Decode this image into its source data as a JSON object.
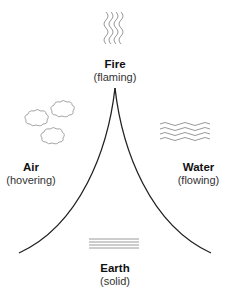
{
  "elements": {
    "fire": {
      "name": "Fire",
      "state": "(flaming)"
    },
    "air": {
      "name": "Air",
      "state": "(hovering)"
    },
    "water": {
      "name": "Water",
      "state": "(flowing)"
    },
    "earth": {
      "name": "Earth",
      "state": "(solid)"
    }
  },
  "icons": {
    "fire": "wavy-vertical-lines-icon",
    "air": "clouds-icon",
    "water": "wavy-horizontal-lines-icon",
    "earth": "straight-horizontal-lines-icon"
  },
  "colors": {
    "curve": "#222222",
    "icon_stroke": "#9a9a9a",
    "text": "#111111"
  }
}
